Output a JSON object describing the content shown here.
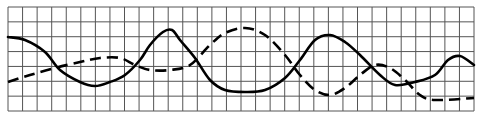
{
  "figure": {
    "background": "#ffffff",
    "grid_color": "#555555",
    "line_color": "#000000"
  },
  "grid": {
    "x0": 8,
    "x1": 474,
    "y0": 7,
    "y1": 111,
    "cols": 32,
    "rows": 7
  },
  "chart_data": {
    "type": "line",
    "title": "",
    "xlabel": "",
    "ylabel": "",
    "grid": true,
    "legend": [],
    "series": [
      {
        "name": "solid",
        "style": "solid",
        "points": [
          [
            8,
            37
          ],
          [
            25,
            40
          ],
          [
            45,
            52
          ],
          [
            60,
            70
          ],
          [
            80,
            82
          ],
          [
            95,
            86
          ],
          [
            110,
            82
          ],
          [
            125,
            75
          ],
          [
            140,
            60
          ],
          [
            150,
            45
          ],
          [
            163,
            32
          ],
          [
            172,
            30
          ],
          [
            180,
            40
          ],
          [
            195,
            58
          ],
          [
            210,
            80
          ],
          [
            225,
            90
          ],
          [
            245,
            92
          ],
          [
            265,
            90
          ],
          [
            285,
            78
          ],
          [
            300,
            60
          ],
          [
            315,
            40
          ],
          [
            330,
            35
          ],
          [
            345,
            42
          ],
          [
            360,
            55
          ],
          [
            380,
            75
          ],
          [
            395,
            85
          ],
          [
            415,
            82
          ],
          [
            435,
            75
          ],
          [
            448,
            60
          ],
          [
            460,
            56
          ],
          [
            474,
            65
          ]
        ]
      },
      {
        "name": "dashed",
        "style": "dashed",
        "points": [
          [
            8,
            82
          ],
          [
            30,
            75
          ],
          [
            55,
            68
          ],
          [
            80,
            62
          ],
          [
            100,
            58
          ],
          [
            120,
            58
          ],
          [
            135,
            65
          ],
          [
            150,
            70
          ],
          [
            170,
            70
          ],
          [
            190,
            65
          ],
          [
            210,
            45
          ],
          [
            225,
            33
          ],
          [
            245,
            28
          ],
          [
            265,
            35
          ],
          [
            285,
            55
          ],
          [
            300,
            75
          ],
          [
            315,
            90
          ],
          [
            330,
            95
          ],
          [
            345,
            88
          ],
          [
            360,
            75
          ],
          [
            375,
            65
          ],
          [
            390,
            68
          ],
          [
            405,
            80
          ],
          [
            420,
            95
          ],
          [
            435,
            100
          ],
          [
            474,
            98
          ]
        ]
      }
    ]
  }
}
